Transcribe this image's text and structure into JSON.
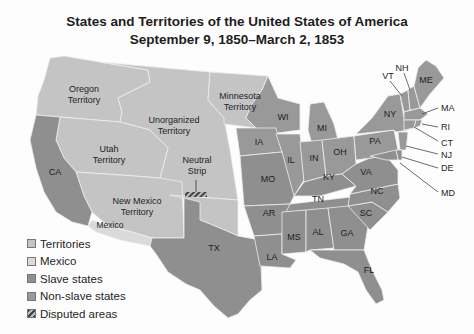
{
  "title": {
    "line1": "States and Territories of the United States of America",
    "line2": "September 9, 1850–March 2, 1853"
  },
  "colors": {
    "territory": "#c4c4c4",
    "mexico": "#dadada",
    "slave": "#8f8f8f",
    "nonslave": "#999999",
    "border": "#e8e8e8",
    "disputed": "#555555"
  },
  "regions": {
    "oregon": "Oregon Territory",
    "oregon_l1": "Oregon",
    "oregon_l2": "Territory",
    "unorganized_l1": "Unorganized",
    "unorganized_l2": "Territory",
    "minnesota_l1": "Minnesota",
    "minnesota_l2": "Territory",
    "utah_l1": "Utah",
    "utah_l2": "Territory",
    "newmexico_l1": "New Mexico",
    "newmexico_l2": "Territory",
    "neutral_l1": "Neutral",
    "neutral_l2": "Strip",
    "mexico": "Mexico"
  },
  "states": {
    "CA": "CA",
    "TX": "TX",
    "WI": "WI",
    "MI": "MI",
    "IA": "IA",
    "IL": "IL",
    "IN": "IN",
    "OH": "OH",
    "MO": "MO",
    "KY": "KY",
    "AR": "AR",
    "TN": "TN",
    "LA": "LA",
    "MS": "MS",
    "AL": "AL",
    "GA": "GA",
    "FL": "FL",
    "SC": "SC",
    "NC": "NC",
    "VA": "VA",
    "PA": "PA",
    "NY": "NY",
    "VT": "VT",
    "NH": "NH",
    "ME": "ME",
    "MA": "MA",
    "RI": "RI",
    "CT": "CT",
    "NJ": "NJ",
    "DE": "DE",
    "MD": "MD"
  },
  "legend": {
    "items": [
      {
        "label": "Territories",
        "color": "#c4c4c4"
      },
      {
        "label": "Mexico",
        "color": "#dadada"
      },
      {
        "label": "Slave states",
        "color": "#8f8f8f"
      },
      {
        "label": "Non-slave states",
        "color": "#999999"
      },
      {
        "label": "Disputed areas",
        "color": "hatched"
      }
    ]
  }
}
